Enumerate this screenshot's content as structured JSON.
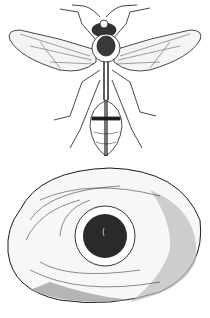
{
  "illustration": {
    "subject_top": "wasp",
    "subject_bottom": "nest",
    "style": "engraving",
    "colors": {
      "ink": "#1a1a1a",
      "paper": "#ffffff",
      "shade": "#555555"
    }
  }
}
